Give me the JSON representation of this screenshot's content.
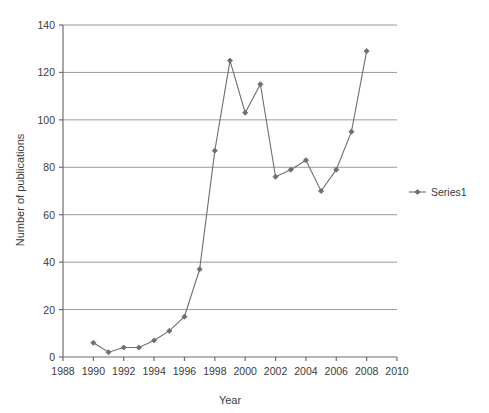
{
  "chart_data": {
    "type": "line",
    "title": "",
    "xlabel": "Year",
    "ylabel": "Number of publications",
    "xlim": [
      1988,
      2010
    ],
    "ylim": [
      0,
      140
    ],
    "xticks": [
      1988,
      1990,
      1992,
      1994,
      1996,
      1998,
      2000,
      2002,
      2004,
      2006,
      2008,
      2010
    ],
    "yticks": [
      0,
      20,
      40,
      60,
      80,
      100,
      120,
      140
    ],
    "grid": "horizontal",
    "legend_position": "right",
    "x": [
      1990,
      1991,
      1992,
      1993,
      1994,
      1995,
      1996,
      1997,
      1998,
      1999,
      2000,
      2001,
      2002,
      2003,
      2004,
      2005,
      2006,
      2007,
      2008
    ],
    "series": [
      {
        "name": "Series1",
        "color": "#6e6e6e",
        "marker": "diamond",
        "values": [
          6,
          2,
          4,
          4,
          7,
          11,
          17,
          37,
          87,
          125,
          103,
          115,
          76,
          79,
          83,
          70,
          79,
          95,
          129
        ]
      }
    ]
  },
  "legend": {
    "entries": [
      {
        "label": "Series1"
      }
    ]
  },
  "axis": {
    "x_title": "Year",
    "y_title": "Number of publications",
    "x_tick_labels": [
      "1988",
      "1990",
      "1992",
      "1994",
      "1996",
      "1998",
      "2000",
      "2002",
      "2004",
      "2006",
      "2008",
      "2010"
    ],
    "y_tick_labels": [
      "0",
      "20",
      "40",
      "60",
      "80",
      "100",
      "120",
      "140"
    ]
  },
  "colors": {
    "series": "#6e6e6e",
    "grid": "#9a9a9a",
    "axis": "#6e6e6e",
    "text": "#3a3a3a",
    "background": "#ffffff"
  }
}
